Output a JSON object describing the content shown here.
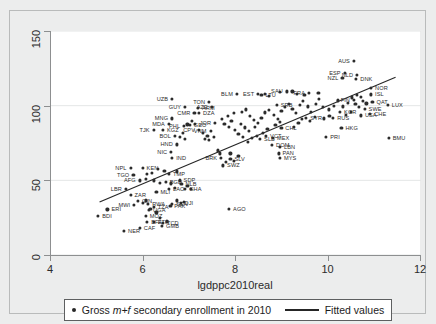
{
  "chart": {
    "type": "scatter",
    "xlabel": "lgdppc2010real",
    "ylabel": "",
    "title": "",
    "xlim": [
      4,
      12
    ],
    "ylim": [
      0,
      150
    ],
    "xticks": [
      "4",
      "6",
      "8",
      "10",
      "12"
    ],
    "yticks": [
      "0",
      "50",
      "100",
      "150"
    ],
    "grid": "horizontal-light",
    "legend_position": "bottom",
    "marker_color": "#2b2b2b",
    "line_color": "#262626",
    "plot_bg": "#ffffff",
    "figure_bg": "#eceded"
  },
  "legend": {
    "scatter_label_pre": "Gross ",
    "scatter_label_em": "m+f",
    "scatter_label_post": " secondary enrollment in 2010",
    "line_label": "Fitted values"
  },
  "chart_data": {
    "type": "scatter",
    "title": "",
    "xlabel": "lgdppc2010real",
    "ylabel": "Gross m+f secondary enrollment in 2010",
    "xlim": [
      4,
      12
    ],
    "ylim": [
      0,
      150
    ],
    "xticks": [
      4,
      6,
      8,
      10,
      12
    ],
    "yticks": [
      0,
      50,
      100,
      150
    ],
    "grid": true,
    "legend": [
      "Gross m+f secondary enrollment in 2010",
      "Fitted values"
    ],
    "fitted_line": {
      "x": [
        5.05,
        11.45
      ],
      "y": [
        35.5,
        119.0
      ]
    },
    "points": [
      {
        "label": "BDI",
        "lpos": "right",
        "x": 5.02,
        "y": 26.0
      },
      {
        "label": "ERI",
        "lpos": "right",
        "x": 5.22,
        "y": 30.5
      },
      {
        "label": "LBR",
        "lpos": "left",
        "x": 5.62,
        "y": 44.5
      },
      {
        "label": "NER",
        "lpos": "right",
        "x": 5.58,
        "y": 16.0
      },
      {
        "label": "CAF",
        "lpos": "right",
        "x": 5.92,
        "y": 18.0
      },
      {
        "label": "AFG",
        "lpos": "left",
        "x": 5.92,
        "y": 50.0
      },
      {
        "label": "TGO",
        "lpos": "left",
        "x": 5.78,
        "y": 53.5
      },
      {
        "label": "NPL",
        "lpos": "left",
        "x": 5.72,
        "y": 58.5
      },
      {
        "label": "KEN",
        "lpos": "right",
        "x": 5.98,
        "y": 58.5
      },
      {
        "label": "ZAR",
        "lpos": "right",
        "x": 5.72,
        "y": 40.0
      },
      {
        "label": "GIN",
        "lpos": "right",
        "x": 5.88,
        "y": 36.0
      },
      {
        "label": "MWI",
        "lpos": "left",
        "x": 5.8,
        "y": 33.5
      },
      {
        "label": "MOZ",
        "lpos": "right",
        "x": 6.05,
        "y": 26.0
      },
      {
        "label": "BFA",
        "lpos": "right",
        "x": 6.08,
        "y": 22.0
      },
      {
        "label": "TZA",
        "lpos": "right",
        "x": 6.22,
        "y": 32.0
      },
      {
        "label": "UGA",
        "lpos": "right",
        "x": 6.12,
        "y": 30.0
      },
      {
        "label": "RWA",
        "lpos": "right",
        "x": 6.1,
        "y": 34.0
      },
      {
        "label": "ETH",
        "lpos": "right",
        "x": 6.22,
        "y": 22.0
      },
      {
        "label": "TCD",
        "lpos": "right",
        "x": 6.42,
        "y": 21.5
      },
      {
        "label": "GMB",
        "lpos": "right",
        "x": 6.4,
        "y": 19.5
      },
      {
        "label": "MLI",
        "lpos": "right",
        "x": 6.28,
        "y": 42.0
      },
      {
        "label": "SEN",
        "lpos": "right",
        "x": 6.62,
        "y": 34.0
      },
      {
        "label": "PAK",
        "lpos": "right",
        "x": 6.58,
        "y": 33.0
      },
      {
        "label": "DJI",
        "lpos": "right",
        "x": 6.8,
        "y": 35.0
      },
      {
        "label": "LAO",
        "lpos": "right",
        "x": 6.55,
        "y": 44.0
      },
      {
        "label": "BGD",
        "lpos": "right",
        "x": 6.48,
        "y": 49.0
      },
      {
        "label": "SDP",
        "lpos": "right",
        "x": 6.78,
        "y": 50.0
      },
      {
        "label": "NLB",
        "lpos": "right",
        "x": 6.82,
        "y": 47.5
      },
      {
        "label": "GHA",
        "lpos": "right",
        "x": 6.9,
        "y": 44.0
      },
      {
        "label": "TMP",
        "lpos": "right",
        "x": 6.55,
        "y": 54.5
      },
      {
        "label": "IND",
        "lpos": "right",
        "x": 6.62,
        "y": 65.0
      },
      {
        "label": "NIC",
        "lpos": "left",
        "x": 6.6,
        "y": 69.0
      },
      {
        "label": "HND",
        "lpos": "left",
        "x": 6.72,
        "y": 74.0
      },
      {
        "label": "BOL",
        "lpos": "left",
        "x": 6.68,
        "y": 80.0
      },
      {
        "label": "MDA",
        "lpos": "left",
        "x": 6.55,
        "y": 88.0
      },
      {
        "label": "MNG",
        "lpos": "left",
        "x": 6.62,
        "y": 91.5
      },
      {
        "label": "PHL",
        "lpos": "left",
        "x": 6.88,
        "y": 86.5
      },
      {
        "label": "GEO",
        "lpos": "right",
        "x": 7.0,
        "y": 87.0
      },
      {
        "label": "GUY",
        "lpos": "left",
        "x": 6.9,
        "y": 99.0
      },
      {
        "label": "UZB",
        "lpos": "left",
        "x": 6.62,
        "y": 104.5
      },
      {
        "label": "TJK",
        "lpos": "left",
        "x": 6.22,
        "y": 84.0
      },
      {
        "label": "KGZ",
        "lpos": "right",
        "x": 6.42,
        "y": 84.0
      },
      {
        "label": "ARM",
        "lpos": "right",
        "x": 7.18,
        "y": 98.5
      },
      {
        "label": "CMR",
        "lpos": "left",
        "x": 7.1,
        "y": 95.0
      },
      {
        "label": "DZA",
        "lpos": "right",
        "x": 7.2,
        "y": 95.0
      },
      {
        "label": "AZE",
        "lpos": "left",
        "x": 7.48,
        "y": 99.0
      },
      {
        "label": "TON",
        "lpos": "left",
        "x": 7.42,
        "y": 102.5
      },
      {
        "label": "CPV",
        "lpos": "left",
        "x": 7.2,
        "y": 84.0
      },
      {
        "label": "JOR",
        "lpos": "left",
        "x": 7.55,
        "y": 88.5
      },
      {
        "label": "VNM",
        "lpos": "left",
        "x": 7.45,
        "y": 83.0
      },
      {
        "label": "BRK",
        "lpos": "left",
        "x": 7.68,
        "y": 65.0
      },
      {
        "label": "SWZ",
        "lpos": "right",
        "x": 7.72,
        "y": 60.0
      },
      {
        "label": "SLV",
        "lpos": "right",
        "x": 7.88,
        "y": 64.5
      },
      {
        "label": "AGO",
        "lpos": "right",
        "x": 7.85,
        "y": 31.0
      },
      {
        "label": "BLM",
        "lpos": "left",
        "x": 8.02,
        "y": 108.0
      },
      {
        "label": "EST",
        "lpos": "left",
        "x": 8.48,
        "y": 108.0
      },
      {
        "label": "LTU",
        "lpos": "right",
        "x": 8.55,
        "y": 107.0
      },
      {
        "label": "SAU",
        "lpos": "left",
        "x": 9.1,
        "y": 109.5
      },
      {
        "label": "SRB",
        "lpos": "right",
        "x": 8.88,
        "y": 100.5
      },
      {
        "label": "SLB",
        "lpos": "right",
        "x": 8.52,
        "y": 78.0
      },
      {
        "label": "VCT",
        "lpos": "right",
        "x": 8.65,
        "y": 79.5
      },
      {
        "label": "MEX",
        "lpos": "right",
        "x": 8.8,
        "y": 78.5
      },
      {
        "label": "CHL",
        "lpos": "right",
        "x": 8.98,
        "y": 85.0
      },
      {
        "label": "DOM",
        "lpos": "right",
        "x": 8.78,
        "y": 73.5
      },
      {
        "label": "LBN",
        "lpos": "right",
        "x": 8.95,
        "y": 72.5
      },
      {
        "label": "PAN",
        "lpos": "right",
        "x": 8.92,
        "y": 68.0
      },
      {
        "label": "MYS",
        "lpos": "right",
        "x": 8.95,
        "y": 65.0
      },
      {
        "label": "SYR",
        "lpos": "right",
        "x": 9.52,
        "y": 92.0
      },
      {
        "label": "FRA",
        "lpos": "left",
        "x": 9.58,
        "y": 108.5
      },
      {
        "label": "NZL",
        "lpos": "left",
        "x": 10.3,
        "y": 118.5
      },
      {
        "label": "ESP",
        "lpos": "left",
        "x": 10.35,
        "y": 122.0
      },
      {
        "label": "AUS",
        "lpos": "left",
        "x": 10.55,
        "y": 130.0
      },
      {
        "label": "NLD",
        "lpos": "left",
        "x": 10.62,
        "y": 120.5
      },
      {
        "label": "DNK",
        "lpos": "right",
        "x": 10.6,
        "y": 118.0
      },
      {
        "label": "NOR",
        "lpos": "right",
        "x": 10.92,
        "y": 112.0
      },
      {
        "label": "ISL",
        "lpos": "right",
        "x": 10.92,
        "y": 107.5
      },
      {
        "label": "QAT",
        "lpos": "right",
        "x": 10.95,
        "y": 102.5
      },
      {
        "label": "LUX",
        "lpos": "right",
        "x": 11.28,
        "y": 100.5
      },
      {
        "label": "SWE",
        "lpos": "right",
        "x": 10.78,
        "y": 98.0
      },
      {
        "label": "CHE",
        "lpos": "right",
        "x": 10.9,
        "y": 94.5
      },
      {
        "label": "USA",
        "lpos": "right",
        "x": 10.7,
        "y": 93.5
      },
      {
        "label": "KOR",
        "lpos": "right",
        "x": 10.25,
        "y": 96.0
      },
      {
        "label": "RUS",
        "lpos": "right",
        "x": 10.1,
        "y": 92.0
      },
      {
        "label": "FIN",
        "lpos": "left",
        "x": 10.55,
        "y": 104.0
      },
      {
        "label": "HKG",
        "lpos": "right",
        "x": 10.28,
        "y": 85.0
      },
      {
        "label": "PRI",
        "lpos": "right",
        "x": 9.95,
        "y": 79.0
      },
      {
        "label": "BMU",
        "lpos": "right",
        "x": 11.3,
        "y": 78.5
      }
    ],
    "unlabeled_points": [
      {
        "x": 7.32,
        "y": 78.0
      },
      {
        "x": 7.38,
        "y": 80.0
      },
      {
        "x": 7.28,
        "y": 81.5
      },
      {
        "x": 7.42,
        "y": 77.0
      },
      {
        "x": 7.52,
        "y": 79.0
      },
      {
        "x": 7.6,
        "y": 70.0
      },
      {
        "x": 7.66,
        "y": 68.0
      },
      {
        "x": 7.78,
        "y": 62.5
      },
      {
        "x": 7.95,
        "y": 63.0
      },
      {
        "x": 8.05,
        "y": 66.5
      },
      {
        "x": 7.88,
        "y": 68.0
      },
      {
        "x": 7.95,
        "y": 95.0
      },
      {
        "x": 8.12,
        "y": 96.0
      },
      {
        "x": 8.22,
        "y": 97.5
      },
      {
        "x": 8.3,
        "y": 93.0
      },
      {
        "x": 8.38,
        "y": 90.5
      },
      {
        "x": 8.1,
        "y": 88.0
      },
      {
        "x": 8.2,
        "y": 85.5
      },
      {
        "x": 8.28,
        "y": 83.0
      },
      {
        "x": 8.4,
        "y": 86.0
      },
      {
        "x": 8.48,
        "y": 88.5
      },
      {
        "x": 8.55,
        "y": 92.0
      },
      {
        "x": 8.62,
        "y": 95.5
      },
      {
        "x": 8.72,
        "y": 97.0
      },
      {
        "x": 8.82,
        "y": 94.0
      },
      {
        "x": 8.9,
        "y": 91.0
      },
      {
        "x": 8.98,
        "y": 96.5
      },
      {
        "x": 9.05,
        "y": 99.0
      },
      {
        "x": 9.15,
        "y": 101.0
      },
      {
        "x": 9.22,
        "y": 98.0
      },
      {
        "x": 9.3,
        "y": 95.0
      },
      {
        "x": 9.38,
        "y": 100.5
      },
      {
        "x": 9.45,
        "y": 103.0
      },
      {
        "x": 9.55,
        "y": 99.5
      },
      {
        "x": 9.62,
        "y": 96.0
      },
      {
        "x": 9.72,
        "y": 101.0
      },
      {
        "x": 9.8,
        "y": 104.5
      },
      {
        "x": 9.88,
        "y": 99.0
      },
      {
        "x": 10.0,
        "y": 97.5
      },
      {
        "x": 10.12,
        "y": 100.0
      },
      {
        "x": 10.2,
        "y": 103.5
      },
      {
        "x": 10.32,
        "y": 99.5
      },
      {
        "x": 10.42,
        "y": 102.0
      },
      {
        "x": 10.5,
        "y": 105.5
      },
      {
        "x": 10.58,
        "y": 101.0
      },
      {
        "x": 10.66,
        "y": 99.0
      },
      {
        "x": 10.74,
        "y": 103.0
      },
      {
        "x": 10.82,
        "y": 101.5
      },
      {
        "x": 10.48,
        "y": 96.0
      },
      {
        "x": 10.38,
        "y": 94.0
      },
      {
        "x": 10.02,
        "y": 93.0
      },
      {
        "x": 9.9,
        "y": 91.5
      },
      {
        "x": 9.7,
        "y": 92.5
      },
      {
        "x": 9.6,
        "y": 90.0
      },
      {
        "x": 9.42,
        "y": 91.0
      },
      {
        "x": 9.35,
        "y": 88.5
      },
      {
        "x": 9.25,
        "y": 86.0
      },
      {
        "x": 8.95,
        "y": 89.0
      },
      {
        "x": 8.85,
        "y": 87.0
      },
      {
        "x": 8.68,
        "y": 84.5
      },
      {
        "x": 8.58,
        "y": 82.0
      },
      {
        "x": 8.45,
        "y": 80.0
      },
      {
        "x": 8.35,
        "y": 78.5
      },
      {
        "x": 8.25,
        "y": 76.0
      },
      {
        "x": 8.15,
        "y": 79.0
      },
      {
        "x": 8.05,
        "y": 81.0
      },
      {
        "x": 7.98,
        "y": 83.5
      },
      {
        "x": 7.85,
        "y": 86.0
      },
      {
        "x": 7.75,
        "y": 88.0
      },
      {
        "x": 7.7,
        "y": 91.0
      },
      {
        "x": 7.82,
        "y": 93.0
      },
      {
        "x": 7.9,
        "y": 90.0
      },
      {
        "x": 8.62,
        "y": 108.0
      },
      {
        "x": 8.72,
        "y": 106.5
      },
      {
        "x": 8.95,
        "y": 109.0
      },
      {
        "x": 9.22,
        "y": 109.5
      },
      {
        "x": 9.32,
        "y": 108.0
      },
      {
        "x": 9.48,
        "y": 107.0
      },
      {
        "x": 9.78,
        "y": 108.5
      },
      {
        "x": 10.62,
        "y": 107.0
      },
      {
        "x": 10.7,
        "y": 106.0
      },
      {
        "x": 6.95,
        "y": 87.5
      },
      {
        "x": 7.05,
        "y": 90.0
      },
      {
        "x": 7.12,
        "y": 88.0
      },
      {
        "x": 6.85,
        "y": 82.0
      },
      {
        "x": 6.78,
        "y": 79.0
      },
      {
        "x": 6.9,
        "y": 77.5
      },
      {
        "x": 6.72,
        "y": 56.0
      },
      {
        "x": 6.45,
        "y": 56.5
      },
      {
        "x": 6.32,
        "y": 57.5
      },
      {
        "x": 6.18,
        "y": 55.0
      },
      {
        "x": 6.08,
        "y": 54.5
      },
      {
        "x": 6.05,
        "y": 51.0
      },
      {
        "x": 6.22,
        "y": 50.0
      },
      {
        "x": 6.35,
        "y": 48.5
      },
      {
        "x": 6.6,
        "y": 48.0
      },
      {
        "x": 6.68,
        "y": 45.0
      },
      {
        "x": 6.95,
        "y": 46.0
      },
      {
        "x": 7.02,
        "y": 44.5
      },
      {
        "x": 6.05,
        "y": 36.5
      },
      {
        "x": 5.98,
        "y": 35.0
      },
      {
        "x": 6.15,
        "y": 31.0
      },
      {
        "x": 6.28,
        "y": 28.5
      },
      {
        "x": 6.35,
        "y": 25.0
      },
      {
        "x": 6.5,
        "y": 22.5
      },
      {
        "x": 6.72,
        "y": 36.5
      },
      {
        "x": 6.88,
        "y": 35.5
      }
    ]
  }
}
